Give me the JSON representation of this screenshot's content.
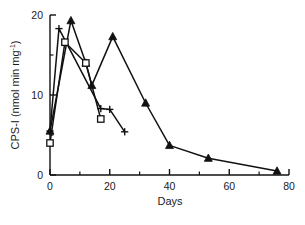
{
  "chart_data": {
    "type": "line",
    "title": "",
    "xlabel": "Days",
    "ylabel": "CPS-I (nmol min mg",
    "ylabel_sup": "-1",
    "ylabel_tail": ")",
    "xlim": [
      0,
      80
    ],
    "ylim": [
      0,
      20
    ],
    "xticks": [
      0,
      20,
      40,
      60,
      80
    ],
    "xtick_labels": [
      "0",
      "20",
      "40",
      "60",
      "80"
    ],
    "yticks": [
      0,
      10,
      20
    ],
    "ytick_labels": [
      "0",
      "10",
      "20"
    ],
    "xminor_ticks": [
      10,
      30,
      50,
      70
    ],
    "yminor_ticks": [
      5,
      15
    ],
    "grid": false,
    "legend": "none",
    "line_color": "#111111",
    "series": [
      {
        "name": "filled-triangle-series",
        "marker": "triangle-filled",
        "x": [
          0,
          7,
          12,
          14,
          21,
          32,
          40,
          53,
          76
        ],
        "y": [
          5.5,
          19.3,
          14.0,
          11.2,
          17.3,
          9.0,
          3.7,
          2.1,
          0.5
        ]
      },
      {
        "name": "open-square-series",
        "marker": "square-open",
        "x": [
          0,
          5,
          12,
          17
        ],
        "y": [
          4.0,
          16.6,
          14.0,
          7.0
        ]
      },
      {
        "name": "plus-series",
        "marker": "plus",
        "x": [
          0,
          3,
          17,
          20,
          25
        ],
        "y": [
          5.5,
          18.3,
          8.3,
          8.2,
          5.4
        ]
      }
    ]
  }
}
